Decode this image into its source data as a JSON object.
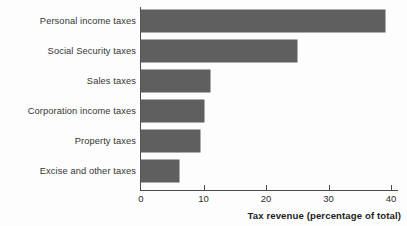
{
  "chart_data": {
    "type": "bar",
    "orientation": "horizontal",
    "title": "",
    "subtitle": "",
    "xlabel": "Tax revenue (percentage of total)",
    "ylabel": "",
    "categories": [
      "Personal income taxes",
      "Social Security taxes",
      "Sales taxes",
      "Corporation income taxes",
      "Property taxes",
      "Excise and other taxes"
    ],
    "values": [
      39,
      25,
      11,
      10,
      9.5,
      6
    ],
    "xlim": [
      0,
      41.5
    ],
    "xticks": [
      0,
      10,
      20,
      30,
      40
    ],
    "xtick_labels": [
      "0",
      "10",
      "20",
      "30",
      "40"
    ],
    "grid": false,
    "legend": null,
    "bar_color": "#5f5f5f",
    "axis_color": "#4a4a4a",
    "background_color": "#fdfdfd"
  },
  "axis": {
    "x_title": "Tax revenue (percentage of total)"
  }
}
